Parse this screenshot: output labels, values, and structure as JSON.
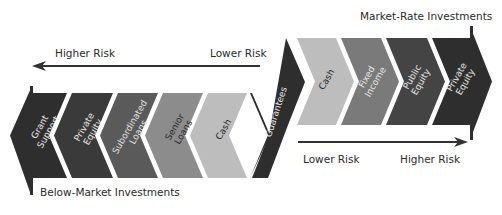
{
  "labels": {
    "market_rate": "Market-Rate Investments",
    "below_market": "Below-Market Investments",
    "top_arrow_left": "Higher Risk",
    "top_arrow_right": "Lower Risk",
    "bottom_arrow_left": "Lower Risk",
    "bottom_arrow_right": "Higher Risk"
  },
  "below_market_segments": [
    {
      "lines": [
        "Grant",
        "Support"
      ],
      "fill": "#2e2e2e",
      "text": "#e8e8e8"
    },
    {
      "lines": [
        "Private",
        "Equity"
      ],
      "fill": "#3a3a3a",
      "text": "#e8e8e8"
    },
    {
      "lines": [
        "Subordinated",
        "Loans"
      ],
      "fill": "#5a5a5a",
      "text": "#e0e0e0"
    },
    {
      "lines": [
        "Senior",
        "Loans"
      ],
      "fill": "#8c8c8c",
      "text": "#2a2a2a"
    },
    {
      "lines": [
        "Cash"
      ],
      "fill": "#bdbdbd",
      "text": "#2a2a2a"
    }
  ],
  "bridge_segment": {
    "lines": [
      "Guarantees"
    ],
    "fill": "#2e2e2e",
    "text": "#e8e8e8"
  },
  "market_rate_segments": [
    {
      "lines": [
        "Cash"
      ],
      "fill": "#bdbdbd",
      "text": "#2a2a2a"
    },
    {
      "lines": [
        "Fixed",
        "Income"
      ],
      "fill": "#7a7a7a",
      "text": "#e8e8e8"
    },
    {
      "lines": [
        "Public",
        "Equity"
      ],
      "fill": "#444444",
      "text": "#e8e8e8"
    },
    {
      "lines": [
        "Private",
        "Equity"
      ],
      "fill": "#2e2e2e",
      "text": "#e8e8e8"
    }
  ],
  "colors": {
    "arrow": "#333333",
    "label": "#2a2a2a"
  }
}
